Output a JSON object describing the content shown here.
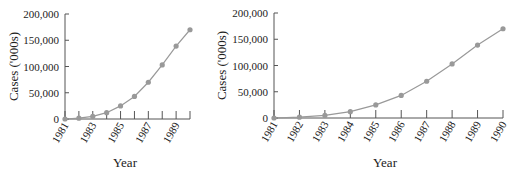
{
  "chart_data": [
    {
      "type": "line",
      "title": "",
      "xlabel": "Year",
      "ylabel": "Cases ('000s)",
      "ylim": [
        0,
        200000
      ],
      "yticks": [
        "0",
        "50,000",
        "100,000",
        "150,000",
        "200,000"
      ],
      "xtick_labels": [
        "1981",
        "1983",
        "1985",
        "1987",
        "1989"
      ],
      "x": [
        1981,
        1982,
        1983,
        1984,
        1985,
        1986,
        1987,
        1988,
        1989,
        1990
      ],
      "values": [
        0,
        1500,
        5000,
        12000,
        25000,
        43000,
        70000,
        103000,
        139000,
        170000
      ],
      "grid": false,
      "legend": null
    },
    {
      "type": "line",
      "title": "",
      "xlabel": "Year",
      "ylabel": "Cases ('000s)",
      "ylim": [
        0,
        200000
      ],
      "yticks": [
        "0",
        "50,000",
        "100,000",
        "150,000",
        "200,000"
      ],
      "xtick_labels": [
        "1981",
        "1982",
        "1983",
        "1984",
        "1985",
        "1986",
        "1987",
        "1988",
        "1989",
        "1990"
      ],
      "x": [
        1981,
        1982,
        1983,
        1984,
        1985,
        1986,
        1987,
        1988,
        1989,
        1990
      ],
      "values": [
        0,
        1500,
        5000,
        12000,
        25000,
        43000,
        70000,
        103000,
        139000,
        170000
      ],
      "grid": false,
      "legend": null
    }
  ]
}
